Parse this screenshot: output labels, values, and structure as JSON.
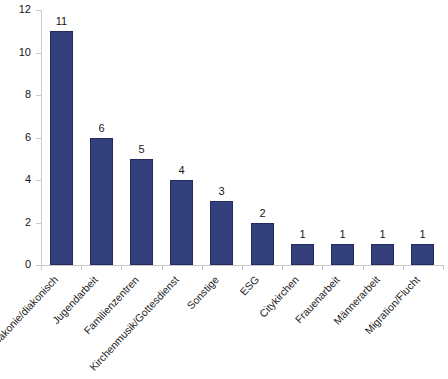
{
  "chart_data": {
    "type": "bar",
    "title": "",
    "subtitle": "",
    "xlabel": "",
    "ylabel": "",
    "categories": [
      "Diakonie/diakonisch",
      "Jugendarbeit",
      "Familienzentren",
      "Kirchenmusik/Gottesdienst",
      "Sonstige",
      "ESG",
      "Citykirchen",
      "Frauenarbeit",
      "Männerarbeit",
      "Migration/Flucht"
    ],
    "values": [
      11,
      6,
      5,
      4,
      3,
      2,
      1,
      1,
      1,
      1
    ],
    "data_labels": [
      "11",
      "6",
      "5",
      "4",
      "3",
      "2",
      "1",
      "1",
      "1",
      "1"
    ],
    "ylim": [
      0,
      12
    ],
    "ytick_labels": [
      "0",
      "2",
      "4",
      "6",
      "8",
      "10",
      "12"
    ],
    "ytick_values": [
      0,
      2,
      4,
      6,
      8,
      10,
      12
    ],
    "grid": false,
    "legend": null,
    "series_color": "#33407c",
    "axis_color": "#c9c9c9",
    "label_rotation_deg": -47
  }
}
